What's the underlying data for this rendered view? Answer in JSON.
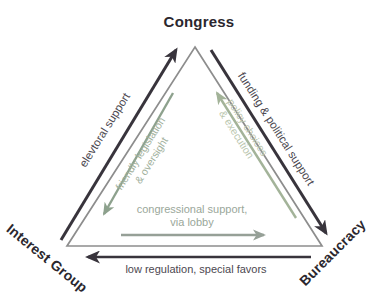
{
  "colors": {
    "background": "#ffffff",
    "node_text": "#2b272e",
    "dark_arrow": "#38343c",
    "dark_label": "#4c4850",
    "triangle_outline": "#8d8d8d",
    "left_inner_arrow": "#8da18d",
    "left_inner_label": "#9fb09c",
    "right_inner_arrow": "#a3b399",
    "right_inner_label": "#bac6ae",
    "bottom_inner_arrow": "#96a097",
    "bottom_inner_label": "#9aa79a"
  },
  "diagram": {
    "type": "iron-triangle",
    "nodes": {
      "congress": "Congress",
      "interest_group": "Interest Group",
      "bureaucracy": "Bureaucracy"
    },
    "edges": {
      "electoral": {
        "label": "elevtoral support",
        "from": "interest_group",
        "to": "congress"
      },
      "funding": {
        "label": "funding & political support",
        "from": "congress",
        "to": "bureaucracy"
      },
      "low_regulation": {
        "label": "low regulation, special favors",
        "from": "bureaucracy",
        "to": "interest_group"
      },
      "friendly_legislation": {
        "line1": "friendly legislation",
        "line2": "& oversight",
        "from": "congress",
        "to": "interest_group"
      },
      "policy_choices": {
        "line1": "policy choices",
        "line2": "& execution",
        "from": "bureaucracy",
        "to": "congress"
      },
      "congressional_support": {
        "line1": "congressional support,",
        "line2": "via lobby",
        "from": "interest_group",
        "to": "bureaucracy"
      }
    }
  }
}
